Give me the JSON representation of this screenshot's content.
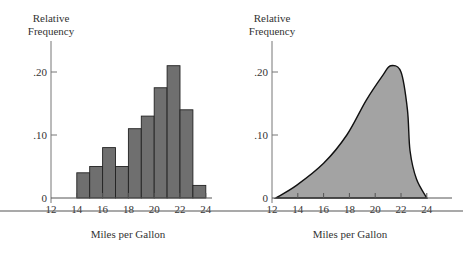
{
  "chart_data": [
    {
      "type": "bar",
      "subtype": "histogram",
      "title": "",
      "xlabel": "Miles per Gallon",
      "ylabel": "Relative Frequency",
      "ylabel_lines": [
        "Relative",
        "Frequency"
      ],
      "xlim": [
        12,
        26
      ],
      "ylim": [
        0,
        0.22
      ],
      "x_ticks": [
        12,
        14,
        16,
        18,
        20,
        22,
        24
      ],
      "x_tick_labels": [
        "12",
        "14",
        "16",
        "18",
        "20",
        "22",
        "24"
      ],
      "y_ticks": [
        0,
        0.1,
        0.2
      ],
      "y_tick_labels": [
        "0",
        ".10",
        ".20"
      ],
      "grid": false,
      "bins": [
        {
          "from": 14,
          "to": 15,
          "value": 0.04
        },
        {
          "from": 15,
          "to": 16,
          "value": 0.05
        },
        {
          "from": 16,
          "to": 17,
          "value": 0.08
        },
        {
          "from": 17,
          "to": 18,
          "value": 0.05
        },
        {
          "from": 18,
          "to": 19,
          "value": 0.11
        },
        {
          "from": 19,
          "to": 20,
          "value": 0.13
        },
        {
          "from": 20,
          "to": 21,
          "value": 0.175
        },
        {
          "from": 21,
          "to": 22,
          "value": 0.21
        },
        {
          "from": 22,
          "to": 23,
          "value": 0.14
        },
        {
          "from": 23,
          "to": 24,
          "value": 0.02
        }
      ],
      "categories": [
        "14-15",
        "15-16",
        "16-17",
        "17-18",
        "18-19",
        "19-20",
        "20-21",
        "21-22",
        "22-23",
        "23-24"
      ],
      "values": [
        0.04,
        0.05,
        0.08,
        0.05,
        0.11,
        0.13,
        0.175,
        0.21,
        0.14,
        0.02
      ],
      "bar_color": "#6f6f6f",
      "edge_color": "#222222"
    },
    {
      "type": "area",
      "subtype": "smooth density curve",
      "title": "",
      "xlabel": "Miles per Gallon",
      "ylabel": "Relative Frequency",
      "ylabel_lines": [
        "Relative",
        "Frequency"
      ],
      "xlim": [
        12,
        26
      ],
      "ylim": [
        0,
        0.22
      ],
      "x_ticks": [
        12,
        14,
        16,
        18,
        20,
        22,
        24
      ],
      "x_tick_labels": [
        "12",
        "14",
        "16",
        "18",
        "20",
        "22",
        "24"
      ],
      "y_ticks": [
        0,
        0.1,
        0.2
      ],
      "y_tick_labels": [
        "0",
        ".10",
        ".20"
      ],
      "grid": false,
      "x": [
        12.3,
        13.9,
        16.0,
        17.8,
        19.3,
        20.6,
        21.2,
        22.0,
        22.5,
        22.7,
        23.2,
        24.0
      ],
      "y": [
        0.0,
        0.02,
        0.055,
        0.1,
        0.155,
        0.195,
        0.21,
        0.2,
        0.14,
        0.075,
        0.03,
        0.0
      ],
      "fill_color": "#a3a3a3",
      "line_color": "#111111"
    }
  ],
  "bottom_rule": true
}
